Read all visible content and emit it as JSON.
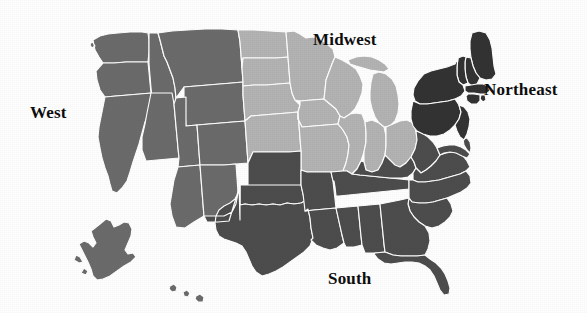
{
  "figure": {
    "background_color": "#ffffff",
    "width": 587,
    "height": 313,
    "border_color": "#ffffff"
  },
  "labels": {
    "midwest": "Midwest",
    "northeast": "Northeast",
    "west": "West",
    "south": "South"
  },
  "regions": [
    {
      "id": "west",
      "label": "West",
      "color": "#6b6b6b",
      "states": [
        "Washington",
        "Oregon",
        "California",
        "Idaho",
        "Nevada",
        "Montana",
        "Wyoming",
        "Utah",
        "Colorado",
        "Arizona",
        "New Mexico",
        "Alaska",
        "Hawaii"
      ]
    },
    {
      "id": "midwest",
      "label": "Midwest",
      "color": "#b3b3b3",
      "states": [
        "North Dakota",
        "South Dakota",
        "Nebraska",
        "Kansas",
        "Minnesota",
        "Iowa",
        "Missouri",
        "Wisconsin",
        "Illinois",
        "Michigan",
        "Indiana",
        "Ohio"
      ]
    },
    {
      "id": "south",
      "label": "South",
      "color": "#4d4d4d",
      "states": [
        "Texas",
        "Oklahoma",
        "Arkansas",
        "Louisiana",
        "Mississippi",
        "Alabama",
        "Tennessee",
        "Kentucky",
        "West Virginia",
        "Virginia",
        "North Carolina",
        "South Carolina",
        "Georgia",
        "Florida",
        "Maryland",
        "Delaware"
      ]
    },
    {
      "id": "northeast",
      "label": "Northeast",
      "color": "#333333",
      "states": [
        "Maine",
        "New Hampshire",
        "Vermont",
        "Massachusetts",
        "Rhode Island",
        "Connecticut",
        "New York",
        "New Jersey",
        "Pennsylvania"
      ]
    }
  ],
  "colors": {
    "west_fill": "#6b6b6b",
    "midwest_fill": "#b3b3b3",
    "south_fill": "#4d4d4d",
    "northeast_fill": "#333333",
    "state_border": "#ffffff",
    "label_text": "#0d0d0d",
    "background": "#ffffff"
  }
}
